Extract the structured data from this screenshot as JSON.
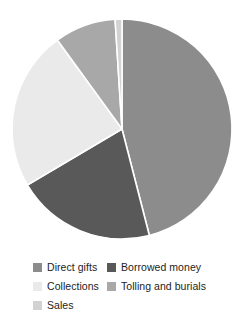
{
  "chart_data": {
    "type": "pie",
    "title": "",
    "subtitle": "",
    "xlabel": "",
    "ylabel": "",
    "grid": false,
    "legend_position": "bottom",
    "start_angle_deg": 0,
    "direction": "clockwise",
    "center": {
      "cx": 122,
      "cy": 129
    },
    "radius": 110,
    "labels": [
      "Direct gifts",
      "Borrowed money",
      "Collections",
      "Tolling and burials",
      "Sales"
    ],
    "values": [
      46,
      20.5,
      23.5,
      9,
      1
    ],
    "slices": [
      {
        "name": "Direct gifts",
        "value": 46,
        "percent": "46%",
        "color": "#8c8c8c",
        "start_deg": 0,
        "end_deg": 165.6
      },
      {
        "name": "Borrowed money",
        "value": 20.5,
        "percent": "20.5%",
        "color": "#595959",
        "start_deg": 165.6,
        "end_deg": 239.4
      },
      {
        "name": "Collections",
        "value": 23.5,
        "percent": "23.5%",
        "color": "#eaeaea",
        "start_deg": 239.4,
        "end_deg": 324.0
      },
      {
        "name": "Tolling and burials",
        "value": 9,
        "percent": "9%",
        "color": "#a8a8a8",
        "start_deg": 324.0,
        "end_deg": 356.4
      },
      {
        "name": "Sales",
        "value": 1,
        "percent": "1%",
        "color": "#d2d2d2",
        "start_deg": 356.4,
        "end_deg": 360.0
      }
    ]
  },
  "legend": {
    "columns": [
      {
        "items": [
          {
            "label": "Direct gifts",
            "color": "#8c8c8c",
            "swatch_name": "legend-swatch-direct-gifts"
          },
          {
            "label": "Collections",
            "color": "#eaeaea",
            "swatch_name": "legend-swatch-collections"
          },
          {
            "label": "Sales",
            "color": "#d2d2d2",
            "swatch_name": "legend-swatch-sales"
          }
        ]
      },
      {
        "items": [
          {
            "label": "Borrowed money",
            "color": "#595959",
            "swatch_name": "legend-swatch-borrowed-money"
          },
          {
            "label": "Tolling and burials",
            "color": "#a8a8a8",
            "swatch_name": "legend-swatch-tolling-and-burials"
          }
        ]
      }
    ]
  },
  "colors": {
    "direct_gifts": "#8c8c8c",
    "borrowed_money": "#595959",
    "collections": "#eaeaea",
    "tolling_and_burials": "#a8a8a8",
    "sales": "#d2d2d2",
    "slice_separator": "#ffffff",
    "background": "#ffffff",
    "text": "#1d1d1d"
  }
}
